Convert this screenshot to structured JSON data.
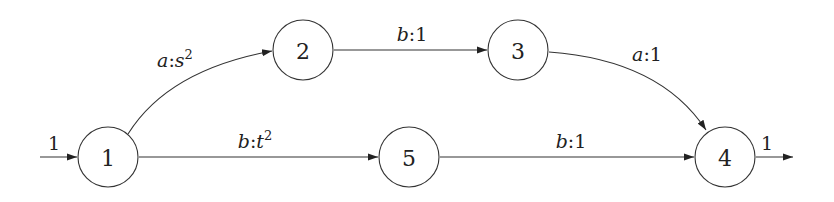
{
  "diagram": {
    "type": "weighted-automaton",
    "nodes": [
      {
        "id": "1",
        "label": "1",
        "cx": 108,
        "cy": 157,
        "initial_weight": "1"
      },
      {
        "id": "2",
        "label": "2",
        "cx": 303,
        "cy": 50
      },
      {
        "id": "3",
        "label": "3",
        "cx": 518,
        "cy": 50
      },
      {
        "id": "5",
        "label": "5",
        "cx": 409,
        "cy": 157
      },
      {
        "id": "4",
        "label": "4",
        "cx": 725,
        "cy": 157,
        "final_weight": "1"
      }
    ],
    "edges": [
      {
        "from": "1",
        "to": "2",
        "symbol": "a",
        "sep": ":",
        "weight_base": "s",
        "weight_exp": "2",
        "label": "a:s^2"
      },
      {
        "from": "2",
        "to": "3",
        "symbol": "b",
        "sep": ":",
        "weight_base": "1",
        "weight_exp": "",
        "label": "b:1"
      },
      {
        "from": "3",
        "to": "4",
        "symbol": "a",
        "sep": ":",
        "weight_base": "1",
        "weight_exp": "",
        "label": "a:1"
      },
      {
        "from": "1",
        "to": "5",
        "symbol": "b",
        "sep": ":",
        "weight_base": "t",
        "weight_exp": "2",
        "label": "b:t^2"
      },
      {
        "from": "5",
        "to": "4",
        "symbol": "b",
        "sep": ":",
        "weight_base": "1",
        "weight_exp": "",
        "label": "b:1"
      }
    ],
    "initial_arrow_label": "1",
    "final_arrow_label": "1"
  }
}
